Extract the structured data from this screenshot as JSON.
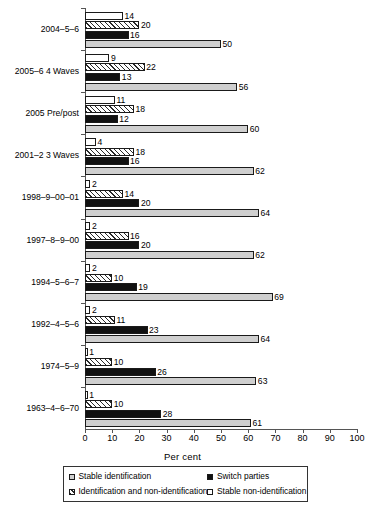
{
  "chart_data": {
    "type": "bar",
    "orientation": "horizontal",
    "title": "",
    "xlabel": "Per cent",
    "ylabel": "",
    "xlim": [
      0,
      100
    ],
    "xticks": [
      0,
      10,
      20,
      30,
      40,
      50,
      60,
      70,
      80,
      90,
      100
    ],
    "grid": false,
    "legend_position": "bottom",
    "categories": [
      "2004–5–6",
      "2005–6 4 Waves",
      "2005 Pre/post",
      "2001–2 3 Waves",
      "1998–9–00–01",
      "1997–8–9–00",
      "1994–5–6–7",
      "1992–4–5–6",
      "1974–5–9",
      "1963–4–6–70"
    ],
    "series": [
      {
        "name": "Stable non-identification",
        "fill": "white",
        "values": [
          14,
          9,
          11,
          4,
          2,
          2,
          2,
          2,
          1,
          1
        ]
      },
      {
        "name": "Identification and non-identification",
        "fill": "hatch",
        "values": [
          20,
          22,
          18,
          18,
          14,
          16,
          10,
          11,
          10,
          10
        ]
      },
      {
        "name": "Switch parties",
        "fill": "black",
        "values": [
          16,
          13,
          12,
          16,
          20,
          20,
          19,
          23,
          26,
          28
        ]
      },
      {
        "name": "Stable identification",
        "fill": "gray",
        "values": [
          50,
          56,
          60,
          62,
          64,
          62,
          69,
          64,
          63,
          61
        ]
      }
    ]
  },
  "legend": {
    "items": [
      {
        "label": "Stable identification",
        "swatch": "gray"
      },
      {
        "label": "Switch parties",
        "swatch": "black"
      },
      {
        "label": "Identification and non-identification",
        "swatch": "hatch"
      },
      {
        "label": "Stable non-identification",
        "swatch": "white"
      }
    ]
  },
  "axis": {
    "x_title": "Per cent"
  }
}
